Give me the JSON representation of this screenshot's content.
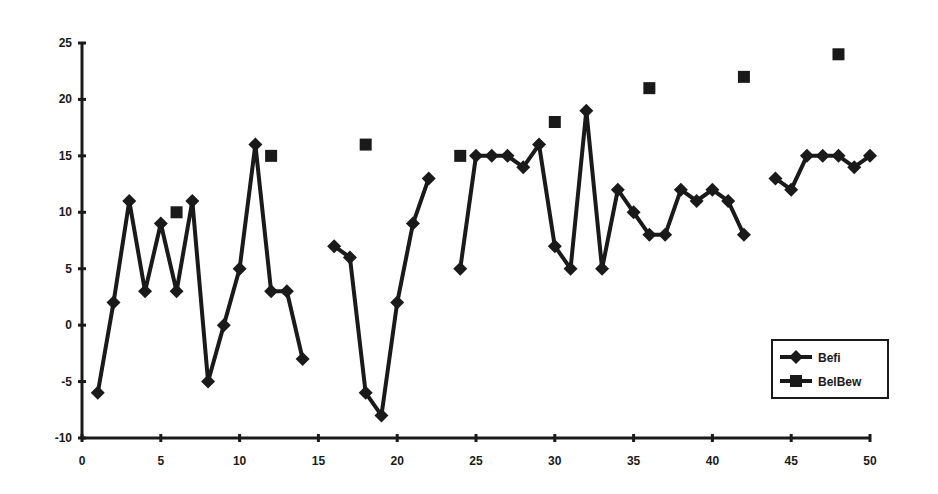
{
  "chart_data": {
    "type": "line",
    "title": "",
    "xlabel": "",
    "ylabel": "",
    "xlim": [
      0,
      50
    ],
    "ylim": [
      -10,
      25
    ],
    "x_ticks": [
      0,
      5,
      10,
      15,
      20,
      25,
      30,
      35,
      40,
      45,
      50
    ],
    "y_ticks": [
      -10,
      -5,
      0,
      5,
      10,
      15,
      20,
      25
    ],
    "grid": false,
    "legend_position": "lower-right",
    "series": [
      {
        "name": "Befi",
        "marker": "diamond",
        "line": true,
        "color": "#1a1a1a",
        "points": [
          [
            1,
            -6
          ],
          [
            2,
            2
          ],
          [
            3,
            11
          ],
          [
            4,
            3
          ],
          [
            5,
            9
          ],
          [
            6,
            3
          ],
          [
            7,
            11
          ],
          [
            8,
            -5
          ],
          [
            9,
            0
          ],
          [
            10,
            5
          ],
          [
            11,
            16
          ],
          [
            12,
            3
          ],
          [
            13,
            3
          ],
          [
            14,
            -3
          ],
          [
            15,
            null
          ],
          [
            16,
            7
          ],
          [
            17,
            6
          ],
          [
            18,
            -6
          ],
          [
            19,
            -8
          ],
          [
            20,
            2
          ],
          [
            21,
            9
          ],
          [
            22,
            13
          ],
          [
            23,
            null
          ],
          [
            24,
            5
          ],
          [
            25,
            15
          ],
          [
            26,
            15
          ],
          [
            27,
            15
          ],
          [
            28,
            14
          ],
          [
            29,
            16
          ],
          [
            30,
            7
          ],
          [
            31,
            5
          ],
          [
            32,
            19
          ],
          [
            33,
            5
          ],
          [
            34,
            12
          ],
          [
            35,
            10
          ],
          [
            36,
            8
          ],
          [
            37,
            8
          ],
          [
            38,
            12
          ],
          [
            39,
            11
          ],
          [
            40,
            12
          ],
          [
            41,
            11
          ],
          [
            42,
            8
          ],
          [
            43,
            null
          ],
          [
            44,
            13
          ],
          [
            45,
            12
          ],
          [
            46,
            15
          ],
          [
            47,
            15
          ],
          [
            48,
            15
          ],
          [
            49,
            14
          ],
          [
            50,
            15
          ]
        ]
      },
      {
        "name": "BelBew",
        "marker": "square",
        "line": false,
        "color": "#1a1a1a",
        "points": [
          [
            6,
            10
          ],
          [
            12,
            15
          ],
          [
            18,
            16
          ],
          [
            24,
            15
          ],
          [
            30,
            18
          ],
          [
            36,
            21
          ],
          [
            42,
            22
          ],
          [
            48,
            24
          ]
        ]
      }
    ]
  },
  "legend": {
    "items": [
      {
        "label": "Befi",
        "marker": "diamond"
      },
      {
        "label": "BelBew",
        "marker": "square"
      }
    ]
  }
}
